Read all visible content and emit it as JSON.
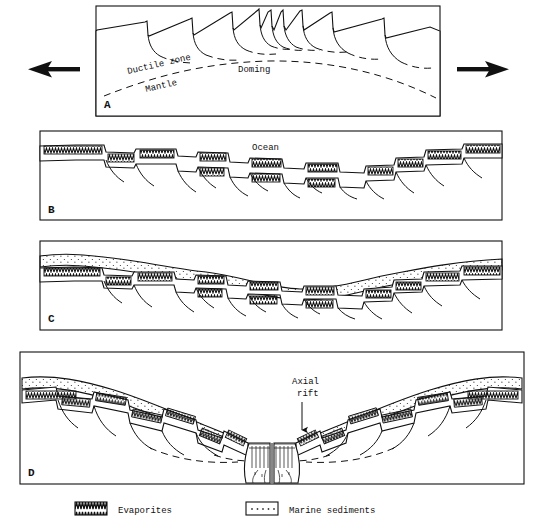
{
  "figure": {
    "background": "#ffffff",
    "ink": "#111111"
  },
  "panels": [
    {
      "id": "A",
      "letter": "A",
      "stage": "doming-and-extension",
      "labels": [
        {
          "name": "ductile-zone-label",
          "text": "Ductile zone",
          "rotation": -13
        },
        {
          "name": "doming-label",
          "text": "Doming",
          "rotation": 0
        },
        {
          "name": "mantle-label",
          "text": "Mantle",
          "rotation": -13
        }
      ],
      "arrows": [
        {
          "name": "extension-arrow-left",
          "direction": "left"
        },
        {
          "name": "extension-arrow-right",
          "direction": "right"
        }
      ]
    },
    {
      "id": "B",
      "letter": "B",
      "stage": "evaporite-deposition",
      "labels": [
        {
          "name": "ocean-label",
          "text": "Ocean",
          "rotation": 0
        }
      ]
    },
    {
      "id": "C",
      "letter": "C",
      "stage": "marine-sediment-onlap",
      "labels": []
    },
    {
      "id": "D",
      "letter": "D",
      "stage": "sea-floor-spreading",
      "labels": [
        {
          "name": "axial-rift-label-line1",
          "text": "Axial",
          "rotation": 0
        },
        {
          "name": "axial-rift-label-line2",
          "text": "rift",
          "rotation": 0
        }
      ],
      "arrows": [
        {
          "name": "axial-rift-pointer",
          "direction": "down"
        }
      ]
    }
  ],
  "legend": {
    "items": [
      {
        "name": "legend-evaporites",
        "swatch": "zigzag-hatch",
        "label": "Evaporites"
      },
      {
        "name": "legend-marine-sediments",
        "swatch": "dotted-fill",
        "label": "Marine sediments"
      }
    ]
  }
}
